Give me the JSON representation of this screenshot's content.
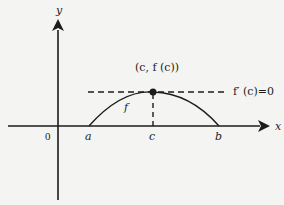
{
  "diagram": {
    "axes": {
      "x_label": "x",
      "y_label": "y",
      "origin_label": "0"
    },
    "points": {
      "a_label": "a",
      "c_label": "c",
      "b_label": "b",
      "max_point_label": "(c, f (c))"
    },
    "curve_label": "f",
    "tangent_label": "f′ (c)=0",
    "colors": {
      "background": "#f4f4f2",
      "ink": "#1c1c1c"
    }
  }
}
